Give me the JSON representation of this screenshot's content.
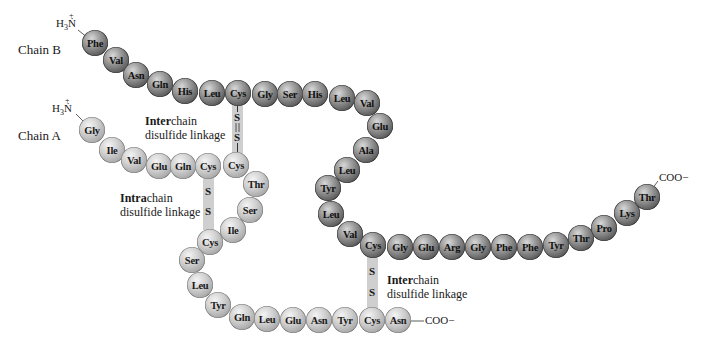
{
  "figure": {
    "chain_b": {
      "label": "Chain B",
      "n_terminus": "H3N+",
      "c_terminus": "COO−",
      "residues": [
        "Phe",
        "Val",
        "Asn",
        "Gln",
        "His",
        "Leu",
        "Cys",
        "Gly",
        "Ser",
        "His",
        "Leu",
        "Val",
        "Glu",
        "Ala",
        "Leu",
        "Tyr",
        "Leu",
        "Val",
        "Cys",
        "Gly",
        "Glu",
        "Arg",
        "Gly",
        "Phe",
        "Phe",
        "Tyr",
        "Thr",
        "Pro",
        "Lys",
        "Thr"
      ],
      "color": "#5a5a5a"
    },
    "chain_a": {
      "label": "Chain A",
      "n_terminus": "H3N+",
      "c_terminus": "COO−",
      "residues": [
        "Gly",
        "Ile",
        "Val",
        "Glu",
        "Gln",
        "Cys",
        "Cys",
        "Thr",
        "Ser",
        "Ile",
        "Cys",
        "Ser",
        "Leu",
        "Tyr",
        "Gln",
        "Leu",
        "Glu",
        "Asn",
        "Tyr",
        "Cys",
        "Asn"
      ],
      "color": "#b0b0b0"
    },
    "linkages": [
      {
        "type_bold": "Inter",
        "type_rest": "chain",
        "line2": "disulfide linkage",
        "from": "B7 Cys",
        "to": "A7 Cys",
        "atoms": [
          "S",
          "S"
        ]
      },
      {
        "type_bold": "Intra",
        "type_rest": "chain",
        "line2": "disulfide linkage",
        "from": "A6 Cys",
        "to": "A11 Cys",
        "atoms": [
          "S",
          "S"
        ]
      },
      {
        "type_bold": "Inter",
        "type_rest": "chain",
        "line2": "disulfide linkage",
        "from": "B19 Cys",
        "to": "A20 Cys",
        "atoms": [
          "S",
          "S"
        ]
      }
    ]
  }
}
